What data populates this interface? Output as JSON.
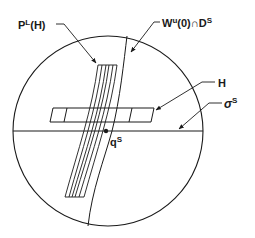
{
  "diagram": {
    "type": "phase-space schematic",
    "labels": {
      "p_l_h": {
        "main": "P",
        "sup": "L",
        "rest": "(H)"
      },
      "w_u": {
        "main": "W",
        "sup": "u",
        "rest": "(0)∩D",
        "sup2": "S"
      },
      "h": {
        "main": "H"
      },
      "sigma_s": {
        "main": "σ",
        "sup": "S"
      },
      "q_s": {
        "main": "q",
        "sup": "S"
      }
    },
    "elements": [
      {
        "id": "disk",
        "shape": "circle",
        "description": "bounding disk D^S"
      },
      {
        "id": "sigma-line",
        "shape": "horizontal line",
        "label": "σ^S"
      },
      {
        "id": "h-box",
        "shape": "slanted rectangle",
        "label": "H"
      },
      {
        "id": "strip",
        "shape": "bundle of 6 slanted lines",
        "label": "P^L(H)"
      },
      {
        "id": "wu-curve",
        "shape": "curve",
        "label": "W^u(0)∩D^S"
      },
      {
        "id": "qs-point",
        "shape": "dot",
        "label": "q^S"
      }
    ],
    "colors": {
      "ink": "#1a1a1a",
      "background": "#ffffff"
    }
  }
}
